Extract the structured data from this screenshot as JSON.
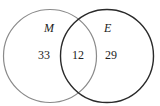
{
  "diagram": {
    "type": "venn",
    "sets": [
      {
        "name": "M",
        "only_count": "33",
        "stroke": "#8a8a8a"
      },
      {
        "name": "E",
        "only_count": "29",
        "stroke": "#2a2a2a"
      }
    ],
    "intersection_count": "12"
  }
}
